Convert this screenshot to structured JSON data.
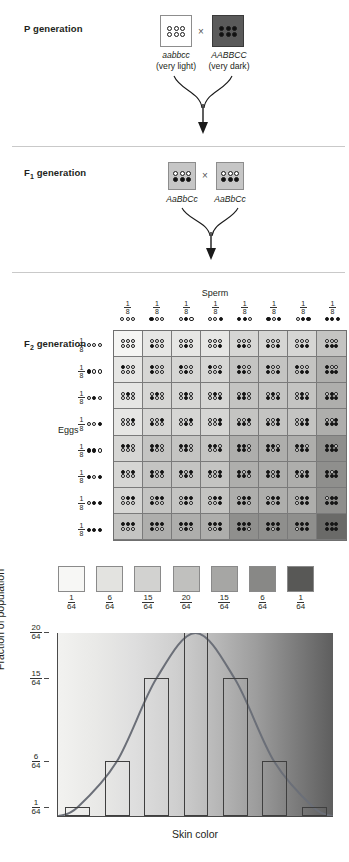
{
  "figure": {
    "topic": "polygenic-inheritance-skin-color"
  },
  "p_generation": {
    "label": "P generation",
    "label_sub": "",
    "cross_symbol": "×",
    "parents": [
      {
        "genotype": "aabbcc",
        "phenotype": "(very light)",
        "alleles": [
          "open",
          "open",
          "open",
          "open",
          "open",
          "open"
        ],
        "box_color": "#ffffff"
      },
      {
        "genotype": "AABBCC",
        "phenotype": "(very dark)",
        "alleles": [
          "fill",
          "fill",
          "fill",
          "fill",
          "fill",
          "fill"
        ],
        "box_color": "#5a5a5a"
      }
    ]
  },
  "f1_generation": {
    "label": "F",
    "label_sub": "1",
    "label_rest": " generation",
    "cross_symbol": "×",
    "parents": [
      {
        "genotype": "AaBbCc",
        "alleles_top": [
          "open",
          "open",
          "open"
        ],
        "alleles_bottom": [
          "fill",
          "fill",
          "fill"
        ],
        "box_color": "#c6c6c6"
      },
      {
        "genotype": "AaBbCc",
        "alleles_top": [
          "open",
          "open",
          "open"
        ],
        "alleles_bottom": [
          "fill",
          "fill",
          "fill"
        ],
        "box_color": "#c6c6c6"
      }
    ]
  },
  "f2_generation": {
    "label": "F",
    "label_sub": "2",
    "label_rest": " generation",
    "sperm_title": "Sperm",
    "eggs_title": "Eggs",
    "gamete_fraction": {
      "num": "1",
      "den": "8"
    },
    "gametes": [
      [
        "open",
        "open",
        "open"
      ],
      [
        "fill",
        "open",
        "open"
      ],
      [
        "open",
        "fill",
        "open"
      ],
      [
        "open",
        "open",
        "fill"
      ],
      [
        "fill",
        "fill",
        "open"
      ],
      [
        "fill",
        "open",
        "fill"
      ],
      [
        "open",
        "fill",
        "fill"
      ],
      [
        "fill",
        "fill",
        "fill"
      ]
    ],
    "gamete_dark_counts": [
      0,
      1,
      1,
      1,
      2,
      2,
      2,
      3
    ]
  },
  "color_scale": {
    "swatches": [
      {
        "color": "#f7f7f5",
        "num": "1",
        "den": "64"
      },
      {
        "color": "#e3e3e0",
        "num": "6",
        "den": "64"
      },
      {
        "color": "#d2d2d0",
        "num": "15",
        "den": "64"
      },
      {
        "color": "#c0c0be",
        "num": "20",
        "den": "64"
      },
      {
        "color": "#a6a6a4",
        "num": "15",
        "den": "64"
      },
      {
        "color": "#888886",
        "num": "6",
        "den": "64"
      },
      {
        "color": "#585856",
        "num": "1",
        "den": "64"
      }
    ]
  },
  "chart_data": {
    "type": "bar",
    "title": "",
    "xlabel": "Skin color",
    "ylabel": "Fraction of population",
    "categories": [
      "0 dark",
      "1 dark",
      "2 dark",
      "3 dark",
      "4 dark",
      "5 dark",
      "6 dark"
    ],
    "values": [
      1,
      6,
      15,
      20,
      15,
      6,
      1
    ],
    "value_labels": [
      "1/64",
      "6/64",
      "15/64",
      "20/64",
      "15/64",
      "6/64",
      "1/64"
    ],
    "denominator": 64,
    "ylim": [
      0,
      20
    ],
    "ytick_values": [
      1,
      6,
      15,
      20
    ],
    "ytick_labels": [
      {
        "num": "1",
        "den": "64"
      },
      {
        "num": "6",
        "den": "64"
      },
      {
        "num": "15",
        "den": "64"
      },
      {
        "num": "20",
        "den": "64"
      }
    ],
    "grid": false,
    "legend": null,
    "overlay_curve": {
      "type": "normal-distribution",
      "color": "#6b6f78",
      "description": "bell curve through bar tops"
    },
    "background": "light-to-dark gradient representing skin color"
  }
}
